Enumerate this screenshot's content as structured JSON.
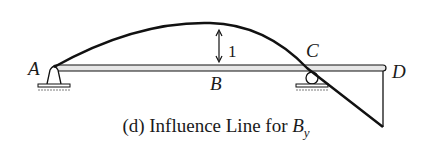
{
  "diagram": {
    "points": [
      {
        "id": "A",
        "label": "A"
      },
      {
        "id": "B",
        "label": "B"
      },
      {
        "id": "C",
        "label": "C"
      },
      {
        "id": "D",
        "label": "D"
      }
    ],
    "ordinate_label": "1",
    "supports": [
      {
        "at": "A",
        "type": "pin"
      },
      {
        "at": "C",
        "type": "roller"
      }
    ],
    "colors": {
      "line": "#111111",
      "beam_fill": "#e6e6e6",
      "ground_hatch": "#bdbdbd"
    }
  },
  "caption": {
    "prefix": "(d) Influence Line for ",
    "symbol": "B",
    "subscript": "y"
  }
}
